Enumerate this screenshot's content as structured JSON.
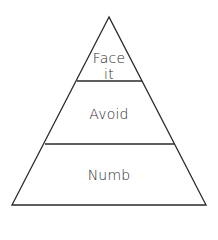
{
  "diagram": {
    "type": "pyramid",
    "tiers": [
      {
        "position": "top",
        "label_line1": "Face",
        "label_line2": "it"
      },
      {
        "position": "middle",
        "label": "Avoid"
      },
      {
        "position": "bottom",
        "label": "Numb"
      }
    ],
    "colors": {
      "stroke": "#2a2a2a",
      "fill": "#ffffff",
      "text": "#2a2a2a"
    }
  }
}
